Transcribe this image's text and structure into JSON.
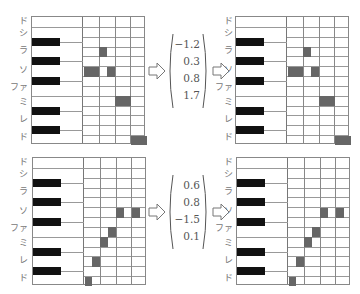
{
  "note_labels": [
    "ド",
    "シ",
    "ラ",
    "ソ",
    "ファ",
    "ミ",
    "レ",
    "ド"
  ],
  "colors": {
    "note_fill": "#666666",
    "black_key": "#111111",
    "grid_line": "#999999"
  },
  "rows": 13,
  "columns": 4,
  "panels": [
    {
      "id": "top-left",
      "notes": [
        {
          "row": 3,
          "col_start": 1.0,
          "col_len": 0.5
        },
        {
          "row": 5,
          "col_start": 0.0,
          "col_len": 1.0
        },
        {
          "row": 5,
          "col_start": 1.5,
          "col_len": 0.5
        },
        {
          "row": 8,
          "col_start": 2.0,
          "col_len": 1.0
        },
        {
          "row": 12,
          "col_start": 3.0,
          "col_len": 1.0
        }
      ]
    },
    {
      "id": "top-right",
      "notes": [
        {
          "row": 3,
          "col_start": 1.0,
          "col_len": 0.5
        },
        {
          "row": 5,
          "col_start": 0.0,
          "col_len": 1.0
        },
        {
          "row": 5,
          "col_start": 1.5,
          "col_len": 0.5
        },
        {
          "row": 8,
          "col_start": 2.0,
          "col_len": 1.0
        },
        {
          "row": 12,
          "col_start": 3.0,
          "col_len": 1.0
        }
      ]
    },
    {
      "id": "bottom-left",
      "notes": [
        {
          "row": 12,
          "col_start": 0.0,
          "col_len": 0.5
        },
        {
          "row": 10,
          "col_start": 0.5,
          "col_len": 0.5
        },
        {
          "row": 8,
          "col_start": 1.0,
          "col_len": 0.5
        },
        {
          "row": 7,
          "col_start": 1.5,
          "col_len": 0.5
        },
        {
          "row": 5,
          "col_start": 2.0,
          "col_len": 0.5
        },
        {
          "row": 5,
          "col_start": 3.0,
          "col_len": 0.5
        }
      ]
    },
    {
      "id": "bottom-right",
      "notes": [
        {
          "row": 12,
          "col_start": 0.0,
          "col_len": 0.5
        },
        {
          "row": 10,
          "col_start": 0.5,
          "col_len": 0.5
        },
        {
          "row": 8,
          "col_start": 1.0,
          "col_len": 0.5
        },
        {
          "row": 7,
          "col_start": 1.5,
          "col_len": 0.5
        },
        {
          "row": 5,
          "col_start": 2.0,
          "col_len": 0.5
        },
        {
          "row": 5,
          "col_start": 3.0,
          "col_len": 0.5
        }
      ]
    }
  ],
  "vectors": {
    "top": [
      "−1.2",
      "0.3",
      "0.8",
      "1.7"
    ],
    "bottom": [
      "0.6",
      "0.8",
      "−1.5",
      "0.1"
    ]
  },
  "icons": {
    "arrow": "hollow-right-arrow-icon"
  }
}
